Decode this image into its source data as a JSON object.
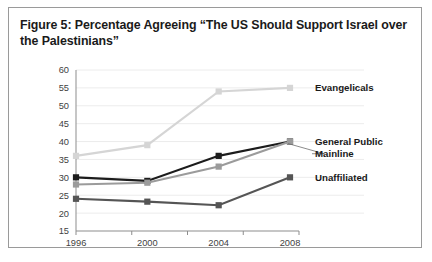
{
  "figure": {
    "caption": "Figure 5: Percentage Agreeing “The US Should Support Israel over the Palestinians”"
  },
  "chart_data": {
    "type": "line",
    "title": "Figure 5: Percentage Agreeing “The US Should Support Israel over the Palestinians”",
    "xlabel": "",
    "ylabel": "",
    "categories": [
      "1996",
      "2000",
      "2004",
      "2008"
    ],
    "x": [
      1996,
      2000,
      2004,
      2008
    ],
    "ylim": [
      15,
      60
    ],
    "ytick_step": 5,
    "yticks": [
      "15",
      "20",
      "25",
      "30",
      "35",
      "40",
      "45",
      "50",
      "55",
      "60"
    ],
    "grid": true,
    "legend_position": "right-inline-labels",
    "series": [
      {
        "name": "Evangelicals",
        "values": [
          36,
          39,
          54,
          55
        ],
        "color": "#d5d5d5",
        "label_y_value": 55
      },
      {
        "name": "General Public",
        "values": [
          30,
          29,
          36,
          40
        ],
        "color": "#1c1c1c",
        "label_y_value": 40
      },
      {
        "name": "Mainline",
        "values": [
          28,
          28.5,
          33,
          40
        ],
        "color": "#9b9b9b",
        "label_y_value": 36.6
      },
      {
        "name": "Unaffiliated",
        "values": [
          24,
          23.2,
          22.2,
          30
        ],
        "color": "#555555",
        "label_y_value": 30
      }
    ]
  },
  "colors": {
    "frame_border": "#9a9a9a",
    "axis": "#8d8d8d",
    "gridline": "#ececec",
    "text": "#1a1a1a",
    "tick_text": "#3f3f3f"
  }
}
